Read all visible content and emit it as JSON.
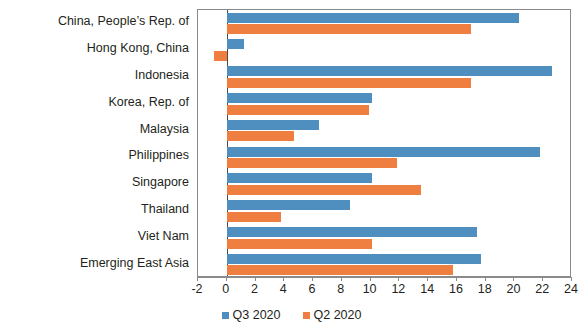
{
  "chart_data": {
    "type": "bar",
    "orientation": "horizontal",
    "title": "",
    "subtitle": "",
    "xlabel": "",
    "ylabel": "",
    "xlim": [
      -2,
      24
    ],
    "xticks": [
      -2,
      0,
      2,
      4,
      6,
      8,
      10,
      12,
      14,
      16,
      18,
      20,
      22,
      24
    ],
    "xtick_labels": [
      "-2",
      "0",
      "2",
      "4",
      "6",
      "8",
      "10",
      "12",
      "14",
      "16",
      "18",
      "20",
      "22",
      "24"
    ],
    "grid": false,
    "legend_position": "bottom-center",
    "categories": [
      "China, People’s Rep. of",
      "Hong Kong, China",
      "Indonesia",
      "Korea, Rep. of",
      "Malaysia",
      "Philippines",
      "Singapore",
      "Thailand",
      "Viet Nam",
      "Emerging East Asia"
    ],
    "series": [
      {
        "name": "Q3 2020",
        "color": "#4f8fc0",
        "values": [
          20.3,
          1.2,
          22.6,
          10.1,
          6.4,
          21.8,
          10.1,
          8.6,
          17.4,
          17.7
        ]
      },
      {
        "name": "Q2 2020",
        "color": "#ee7f40",
        "values": [
          17.0,
          -0.9,
          17.0,
          9.9,
          4.7,
          11.8,
          13.5,
          3.8,
          10.1,
          15.7
        ]
      }
    ]
  },
  "legend": {
    "items": [
      {
        "label": "Q3 2020",
        "color": "#4f8fc0"
      },
      {
        "label": "Q2 2020",
        "color": "#ee7f40"
      }
    ]
  }
}
